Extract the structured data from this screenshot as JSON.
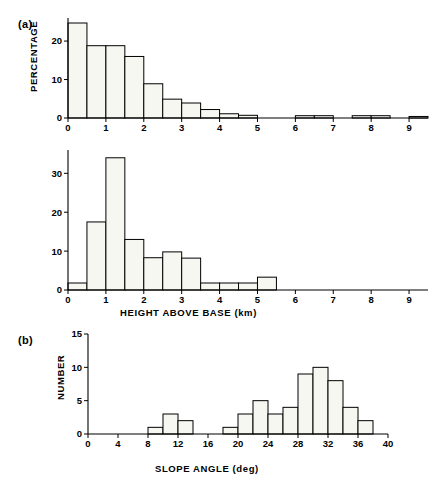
{
  "figure": {
    "panel_a_label": "(a)",
    "panel_b_label": "(b)"
  },
  "chart_data": [
    {
      "id": "hist-top",
      "type": "bar",
      "title": "",
      "xlabel": "HEIGHT ABOVE BASE (km)",
      "ylabel": "PERCENTAGE",
      "xlim": [
        0,
        9.5
      ],
      "ylim": [
        0,
        26
      ],
      "xticks": [
        0,
        1,
        2,
        3,
        4,
        5,
        6,
        7,
        8,
        9
      ],
      "xticklabels": [
        "0",
        "1",
        "2",
        "3",
        "4",
        "5",
        "6",
        "7",
        "8",
        "9"
      ],
      "yticks": [
        0,
        10,
        20
      ],
      "yticklabels": [
        "0",
        "10",
        "20"
      ],
      "grid": false,
      "legend": "none",
      "bin_width": 0.5,
      "bin_edges": [
        0,
        0.5,
        1.0,
        1.5,
        2.0,
        2.5,
        3.0,
        3.5,
        4.0,
        4.5,
        5.0,
        5.5,
        6.0,
        6.5,
        7.0,
        7.5,
        8.0,
        8.5,
        9.0,
        9.5
      ],
      "values": [
        24.7,
        18.8,
        18.8,
        16.0,
        8.9,
        4.9,
        3.9,
        2.2,
        1.1,
        0.7,
        0.0,
        0.0,
        0.6,
        0.6,
        0.0,
        0.6,
        0.6,
        0.0,
        0.4
      ]
    },
    {
      "id": "hist-middle",
      "type": "bar",
      "title": "",
      "xlabel": "HEIGHT ABOVE BASE (km)",
      "ylabel": "PERCENTAGE",
      "xlim": [
        0,
        9.5
      ],
      "ylim": [
        0,
        36
      ],
      "xticks": [
        0,
        1,
        2,
        3,
        4,
        5,
        6,
        7,
        8,
        9
      ],
      "xticklabels": [
        "0",
        "1",
        "2",
        "3",
        "4",
        "5",
        "6",
        "7",
        "8",
        "9"
      ],
      "yticks": [
        0,
        10,
        20,
        30
      ],
      "yticklabels": [
        "0",
        "10",
        "20",
        "30"
      ],
      "grid": false,
      "legend": "none",
      "bin_width": 0.5,
      "bin_edges": [
        0,
        0.5,
        1.0,
        1.5,
        2.0,
        2.5,
        3.0,
        3.5,
        4.0,
        4.5,
        5.0,
        5.5,
        6.0,
        6.5,
        7.0,
        7.5,
        8.0,
        8.5,
        9.0,
        9.5
      ],
      "values": [
        1.8,
        17.5,
        34.0,
        13.0,
        8.3,
        9.8,
        8.2,
        1.8,
        1.8,
        1.8,
        3.3,
        0.0,
        0.0,
        0.0,
        0.0,
        0.0,
        0.0,
        0.0,
        0.0
      ]
    },
    {
      "id": "hist-bottom",
      "type": "bar",
      "title": "",
      "xlabel": "SLOPE ANGLE (deg)",
      "ylabel": "NUMBER",
      "xlim": [
        0,
        40
      ],
      "ylim": [
        0,
        15
      ],
      "xticks": [
        0,
        4,
        8,
        12,
        16,
        20,
        24,
        28,
        32,
        36,
        40
      ],
      "xticklabels": [
        "0",
        "4",
        "8",
        "12",
        "16",
        "20",
        "24",
        "28",
        "32",
        "36",
        "40"
      ],
      "yticks": [
        0,
        5,
        10,
        15
      ],
      "yticklabels": [
        "0",
        "5",
        "10",
        "15"
      ],
      "grid": false,
      "legend": "none",
      "bin_width": 2,
      "bin_edges": [
        0,
        2,
        4,
        6,
        8,
        10,
        12,
        14,
        16,
        18,
        20,
        22,
        24,
        26,
        28,
        30,
        32,
        34,
        36,
        38,
        40
      ],
      "values": [
        0,
        0,
        0,
        0,
        1,
        3,
        2,
        0,
        0,
        1,
        3,
        5,
        3,
        4,
        9,
        10,
        8,
        4,
        2,
        0
      ]
    }
  ]
}
